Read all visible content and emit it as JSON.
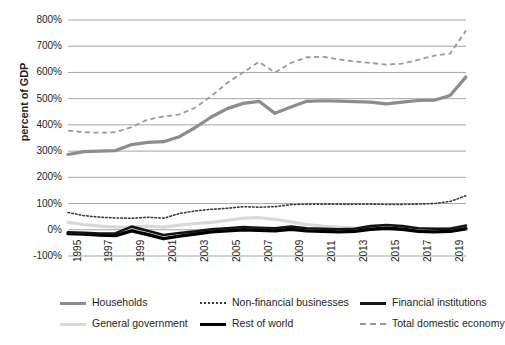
{
  "chart_data": {
    "type": "line",
    "title": "",
    "xlabel": "",
    "ylabel": "percent of GDP",
    "ylim": [
      -100,
      800
    ],
    "yticks": [
      "800%",
      "700%",
      "600%",
      "500%",
      "400%",
      "300%",
      "200%",
      "100%",
      "0%",
      "-100%"
    ],
    "ytick_values": [
      800,
      700,
      600,
      500,
      400,
      300,
      200,
      100,
      0,
      -100
    ],
    "xticks": [
      "1995",
      "1997",
      "1999",
      "2001",
      "2003",
      "2005",
      "2007",
      "2009",
      "2011",
      "2013",
      "2015",
      "2017",
      "2019"
    ],
    "x": [
      1995,
      1996,
      1997,
      1998,
      1999,
      2000,
      2001,
      2002,
      2003,
      2004,
      2005,
      2006,
      2007,
      2008,
      2009,
      2010,
      2011,
      2012,
      2013,
      2014,
      2015,
      2016,
      2017,
      2018,
      2019,
      2020
    ],
    "grid": true,
    "legend_position": "bottom",
    "series": [
      {
        "name": "Households",
        "style": "solid",
        "color": "#8c8c8c",
        "width": 3.2,
        "values": [
          287,
          298,
          300,
          302,
          325,
          333,
          336,
          355,
          390,
          430,
          462,
          482,
          490,
          444,
          468,
          490,
          492,
          491,
          489,
          487,
          480,
          487,
          493,
          494,
          512,
          583
        ]
      },
      {
        "name": "Non-financial businesses",
        "style": "dotted",
        "color": "#3a3a3a",
        "width": 1.6,
        "values": [
          66,
          54,
          48,
          45,
          44,
          48,
          44,
          62,
          72,
          78,
          82,
          88,
          86,
          88,
          96,
          98,
          98,
          98,
          98,
          98,
          97,
          97,
          98,
          100,
          108,
          130
        ]
      },
      {
        "name": "Financial institutions",
        "style": "solid",
        "color": "#141414",
        "width": 2.6,
        "values": [
          -10,
          -12,
          -14,
          -13,
          12,
          -4,
          -20,
          -12,
          -6,
          2,
          6,
          10,
          8,
          6,
          12,
          6,
          4,
          2,
          4,
          14,
          18,
          14,
          6,
          4,
          4,
          16
        ]
      },
      {
        "name": "General government",
        "style": "solid",
        "color": "#d9d9d9",
        "width": 3.2,
        "values": [
          28,
          20,
          14,
          10,
          10,
          14,
          10,
          18,
          24,
          28,
          36,
          44,
          46,
          40,
          30,
          20,
          14,
          10,
          6,
          4,
          4,
          4,
          4,
          4,
          6,
          10
        ]
      },
      {
        "name": "Rest of world",
        "style": "solid",
        "color": "#000000",
        "width": 3.4,
        "values": [
          -14,
          -16,
          -20,
          -22,
          -4,
          -18,
          -34,
          -24,
          -16,
          -8,
          -4,
          0,
          -2,
          -4,
          2,
          -4,
          -6,
          -8,
          -6,
          2,
          6,
          2,
          -6,
          -8,
          -6,
          4
        ]
      },
      {
        "name": "Total domestic economy",
        "style": "dashed",
        "color": "#9a9a9a",
        "width": 1.8,
        "values": [
          378,
          372,
          370,
          372,
          392,
          420,
          432,
          440,
          466,
          510,
          560,
          600,
          640,
          600,
          636,
          658,
          660,
          650,
          642,
          636,
          630,
          634,
          648,
          664,
          672,
          760
        ]
      }
    ]
  },
  "legend": {
    "rows": [
      [
        {
          "label": "Households",
          "key": "households"
        },
        {
          "label": "Non-financial businesses",
          "key": "non-financial-businesses"
        },
        {
          "label": "Financial institutions",
          "key": "financial-institutions"
        }
      ],
      [
        {
          "label": "General government",
          "key": "general-government"
        },
        {
          "label": "Rest of world",
          "key": "rest-of-world"
        },
        {
          "label": "Total domestic economy",
          "key": "total-domestic-economy"
        }
      ]
    ]
  }
}
